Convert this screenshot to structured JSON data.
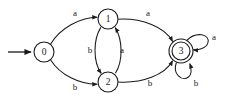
{
  "diagram": {
    "type": "state-transition-diagram",
    "colors": {
      "stroke": "#1a1a1a",
      "fill": "#ffffff",
      "background": "#ffffff"
    },
    "alphabet": [
      "a",
      "b"
    ],
    "start_state": "0",
    "accepting_states": [
      "3"
    ],
    "states": [
      {
        "id": "s0",
        "label": "0",
        "cx": 44,
        "cy": 52,
        "r": 10,
        "accepting": false,
        "start": true
      },
      {
        "id": "s1",
        "label": "1",
        "cx": 108,
        "cy": 19,
        "r": 10,
        "accepting": false,
        "start": false
      },
      {
        "id": "s2",
        "label": "2",
        "cx": 108,
        "cy": 82,
        "r": 10,
        "accepting": false,
        "start": false
      },
      {
        "id": "s3",
        "label": "3",
        "cx": 181,
        "cy": 51,
        "r": 12,
        "accepting": true,
        "start": false
      }
    ],
    "transitions": [
      {
        "id": "t0",
        "from": "0",
        "to": "1",
        "label": "a",
        "label_x": 75,
        "label_y": 14
      },
      {
        "id": "t1",
        "from": "0",
        "to": "2",
        "label": "b",
        "label_x": 75,
        "label_y": 88
      },
      {
        "id": "t2",
        "from": "1",
        "to": "2",
        "label": "b",
        "label_x": 90,
        "label_y": 51
      },
      {
        "id": "t3",
        "from": "2",
        "to": "1",
        "label": "a",
        "label_x": 122,
        "label_y": 51
      },
      {
        "id": "t4",
        "from": "1",
        "to": "3",
        "label": "a",
        "label_x": 148,
        "label_y": 14
      },
      {
        "id": "t5",
        "from": "2",
        "to": "3",
        "label": "b",
        "label_x": 150,
        "label_y": 84
      },
      {
        "id": "t6",
        "from": "3",
        "to": "3",
        "label": "a",
        "label_x": 214,
        "label_y": 38
      },
      {
        "id": "t7",
        "from": "3",
        "to": "3",
        "label": "b",
        "label_x": 196,
        "label_y": 84
      }
    ],
    "start_marker": {
      "x1": 8,
      "y1": 52,
      "x2": 31,
      "y2": 52
    }
  }
}
